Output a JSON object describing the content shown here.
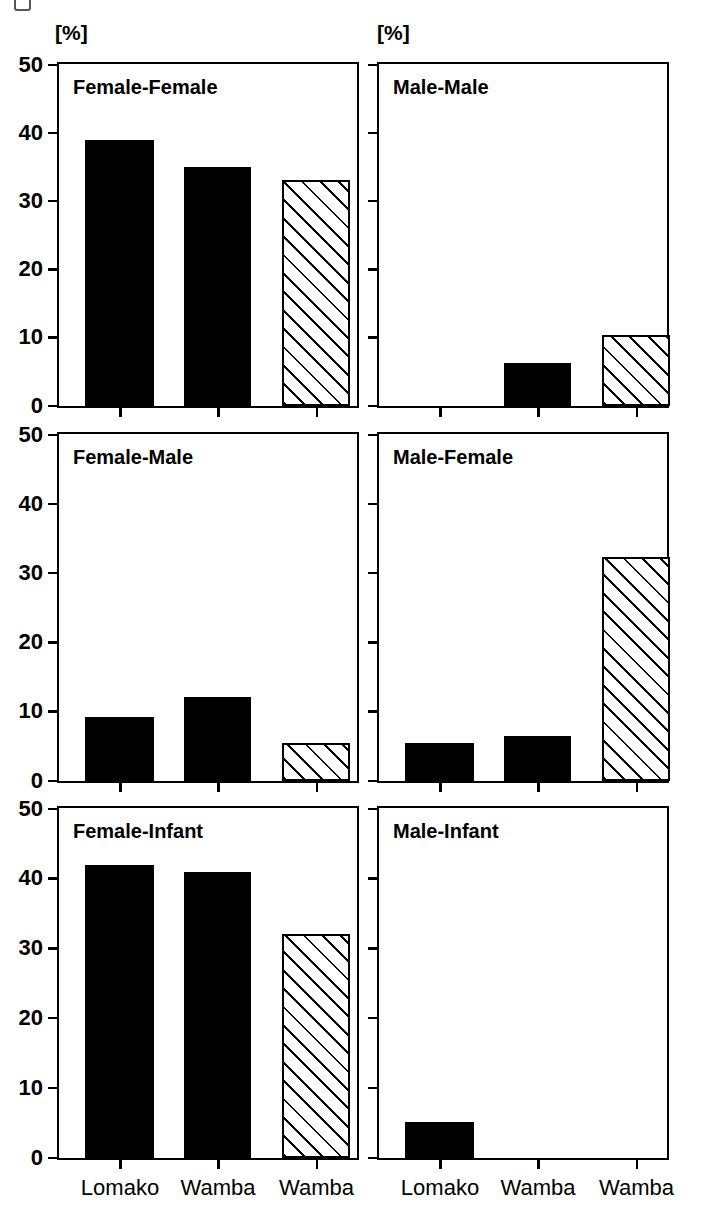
{
  "figure": {
    "unit_label_left": "[%]",
    "unit_label_right": "[%]",
    "y_ticks": [
      "0",
      "10",
      "20",
      "30",
      "40",
      "50"
    ],
    "x_categories": [
      "Lomako",
      "Wamba",
      "Wamba"
    ]
  },
  "chart_data": {
    "type": "bar",
    "title": "",
    "subtitle": "",
    "xlabel": "",
    "ylabel": "[%]",
    "ylim": [
      0,
      50
    ],
    "ytick_values": [
      0,
      10,
      20,
      30,
      40,
      50
    ],
    "grid": false,
    "legend": "none",
    "categories": [
      "Lomako",
      "Wamba",
      "Wamba"
    ],
    "bar_styles": [
      "solid-black",
      "solid-black",
      "hatched-diagonal"
    ],
    "panel_layout": {
      "rows": 3,
      "cols": 2
    },
    "panels": [
      {
        "id": "female-female",
        "title": "Female-Female",
        "row": 1,
        "col": 1,
        "values": [
          39.0,
          35.1,
          33.2
        ]
      },
      {
        "id": "male-male",
        "title": "Male-Male",
        "row": 1,
        "col": 2,
        "values": [
          0.0,
          6.3,
          10.4
        ]
      },
      {
        "id": "female-male",
        "title": "Female-Male",
        "row": 2,
        "col": 1,
        "values": [
          9.2,
          12.2,
          5.5
        ]
      },
      {
        "id": "male-female",
        "title": "Male-Female",
        "row": 2,
        "col": 2,
        "values": [
          5.5,
          6.5,
          32.3
        ]
      },
      {
        "id": "female-infant",
        "title": "Female-Infant",
        "row": 3,
        "col": 1,
        "values": [
          42.0,
          41.0,
          32.1
        ]
      },
      {
        "id": "male-infant",
        "title": "Male-Infant",
        "row": 3,
        "col": 2,
        "values": [
          5.2,
          0.0,
          0.0
        ]
      }
    ]
  }
}
